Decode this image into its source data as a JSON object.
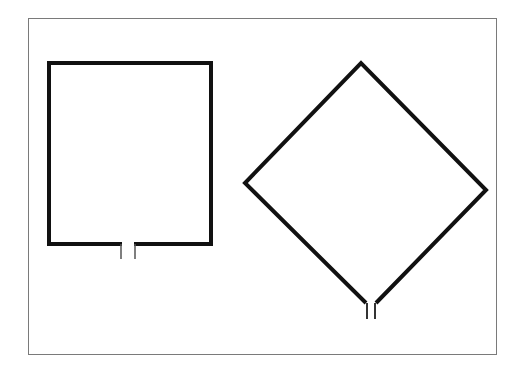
{
  "diagram": {
    "title": "",
    "frame_color": "#7a7a7a",
    "stroke_color": "#111111",
    "shapes": [
      {
        "name": "square-loop-antenna",
        "type": "square",
        "x": 49,
        "y": 63,
        "width": 162,
        "height": 181,
        "stroke_width": 4,
        "feed_gap": {
          "x1": 120,
          "x2": 135,
          "y_top": 244,
          "y_bottom": 259
        }
      },
      {
        "name": "diamond-loop-antenna",
        "type": "diamond",
        "top": [
          361,
          63
        ],
        "left": [
          245,
          183
        ],
        "right": [
          486,
          190
        ],
        "bottom_left": [
          366,
          303
        ],
        "bottom_right": [
          376,
          303
        ],
        "stroke_width": 4,
        "feed_gap": {
          "x1": 367,
          "x2": 375,
          "y_top": 303,
          "y_bottom": 319
        }
      }
    ]
  }
}
